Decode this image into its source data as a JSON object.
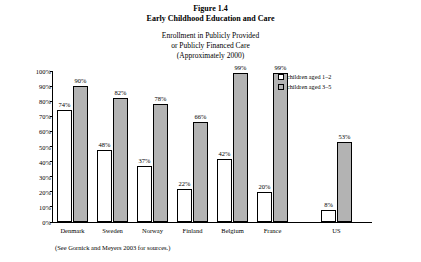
{
  "figure": {
    "number": "Figure 1.4",
    "title": "Early Childhood Education and Care",
    "subtitle_lines": [
      "Enrollment in Publicly Provided",
      "or Publicly Financed Care",
      "(Approximately 2000)"
    ],
    "source_note": "(See Gornick and Meyers 2003 for sources.)"
  },
  "legend": {
    "items": [
      {
        "label": "children aged 1–2",
        "color": "#ffffff"
      },
      {
        "label": "children aged 3–5",
        "color": "#b3b3b3"
      }
    ]
  },
  "chart_data": {
    "type": "bar",
    "title": "Early Childhood Education and Care",
    "subtitle": "Enrollment in Publicly Provided or Publicly Financed Care (Approximately 2000)",
    "xlabel": "",
    "ylabel": "percentage of children in age group enrolled in public care",
    "categories": [
      "Denmark",
      "Sweden",
      "Norway",
      "Finland",
      "Belgium",
      "France",
      "US"
    ],
    "series": [
      {
        "name": "children aged 1–2",
        "color": "#ffffff",
        "values": [
          74,
          48,
          37,
          22,
          42,
          20,
          8
        ],
        "labels": [
          "74%",
          "48%",
          "37%",
          "22%",
          "42%",
          "20%",
          "8%"
        ]
      },
      {
        "name": "children aged 3–5",
        "color": "#b3b3b3",
        "values": [
          90,
          82,
          78,
          66,
          99,
          99,
          53
        ],
        "labels": [
          "90%",
          "82%",
          "78%",
          "66%",
          "99%",
          "99%",
          "53%"
        ]
      }
    ],
    "ylim": [
      0,
      100
    ],
    "yticks": [
      0,
      10,
      20,
      30,
      40,
      50,
      60,
      70,
      80,
      90,
      100
    ],
    "ytick_labels": [
      "0%",
      "10%",
      "20%",
      "30%",
      "40%",
      "50%",
      "60%",
      "70%",
      "80%",
      "90%",
      "100%"
    ],
    "grid": false,
    "legend_position": "top-right"
  }
}
